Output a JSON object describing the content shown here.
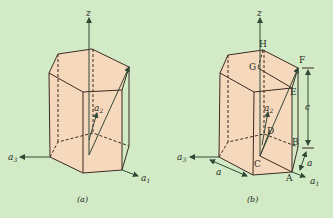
{
  "colors": {
    "background": "#d3eac6",
    "prism_fill": "#f6d9bd",
    "edge": "#3b2a22",
    "axis": "#2f4a36"
  },
  "figure_a": {
    "caption": "(a)",
    "axes": {
      "z": "z",
      "a1": "a",
      "a1_sub": "1",
      "a2": "a",
      "a2_sub": "2",
      "a3": "a",
      "a3_sub": "3"
    }
  },
  "figure_b": {
    "caption": "(b)",
    "axes": {
      "z": "z",
      "a1": "a",
      "a1_sub": "1",
      "a2": "a",
      "a2_sub": "2",
      "a3": "a",
      "a3_sub": "3"
    },
    "points": [
      "A",
      "B",
      "C",
      "D",
      "E",
      "F",
      "G",
      "H"
    ],
    "dimensions": {
      "c": "c",
      "a_right": "a",
      "a_bottom": "a"
    }
  }
}
